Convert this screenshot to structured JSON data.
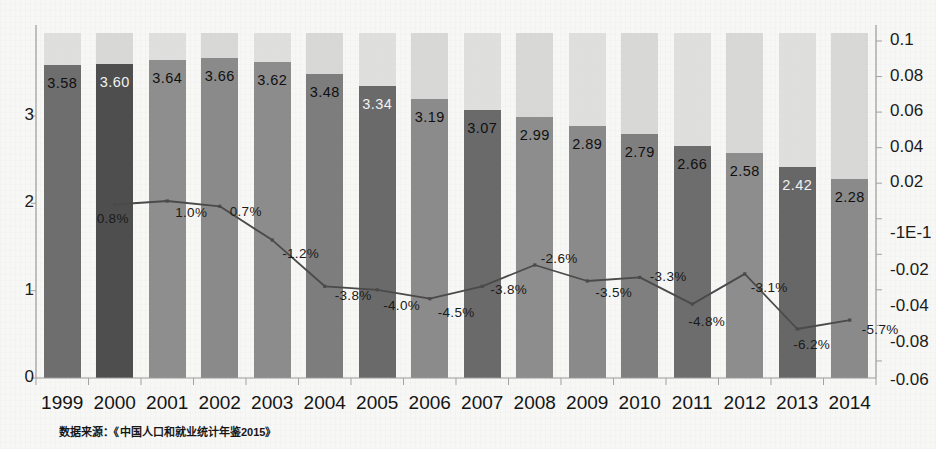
{
  "chart_data": {
    "type": "bar",
    "title": "",
    "subtitle": "",
    "xlabel": "",
    "ylabel": "",
    "grid": false,
    "legend_position": "none",
    "categories": [
      "1999",
      "2000",
      "2001",
      "2002",
      "2003",
      "2004",
      "2005",
      "2006",
      "2007",
      "2008",
      "2009",
      "2010",
      "2011",
      "2012",
      "2013",
      "2014"
    ],
    "series": [
      {
        "name": "bars",
        "type": "bar",
        "axis": "left",
        "values": [
          3.58,
          3.6,
          3.64,
          3.66,
          3.62,
          3.48,
          3.34,
          3.19,
          3.07,
          2.99,
          2.89,
          2.79,
          2.66,
          2.58,
          2.42,
          2.28
        ],
        "labels": [
          "3.58",
          "3.60",
          "3.64",
          "3.66",
          "3.62",
          "3.48",
          "3.34",
          "3.19",
          "3.07",
          "2.99",
          "2.89",
          "2.79",
          "2.66",
          "2.58",
          "2.42",
          "2.28"
        ]
      },
      {
        "name": "line",
        "type": "line",
        "axis": "right",
        "values": [
          null,
          0.008,
          0.01,
          0.007,
          -0.012,
          -0.038,
          -0.04,
          -0.045,
          -0.038,
          -0.026,
          -0.035,
          -0.033,
          -0.048,
          -0.031,
          -0.062,
          -0.057
        ],
        "labels": [
          "",
          "0.8%",
          "1.0%",
          "0.7%",
          "-1.2%",
          "-3.8%",
          "-4.0%",
          "-4.5%",
          "-3.8%",
          "-2.6%",
          "-3.5%",
          "-3.3%",
          "-4.8%",
          "-3.1%",
          "-6.2%",
          "-5.7%"
        ]
      }
    ],
    "left_axis": {
      "ticks": [
        "0",
        "1",
        "2",
        "3"
      ],
      "values": [
        0,
        1,
        2,
        3
      ],
      "ylim": [
        0,
        3.95
      ]
    },
    "right_axis": {
      "ticks": [
        "0.1",
        "0.08",
        "0.06",
        "0.04",
        "0.02",
        "-1E-1",
        "-0.02",
        "-0.04",
        "-0.08",
        "-0.06"
      ],
      "values": [
        0.1,
        0.08,
        0.06,
        0.04,
        0.02,
        0.0,
        -0.02,
        -0.04,
        -0.06,
        -0.08
      ]
    }
  },
  "footer": {
    "source_note": "数据来源：《中国人口和就业统计年鉴2015》"
  },
  "colors": {
    "bar_dark": "#6f6f6f",
    "bar_darker": "#535353",
    "bar_light": "#9a9a9a",
    "band": "#d8d8d8",
    "line": "#4a4a4a",
    "text": "#151515",
    "background": "#f7f7f6"
  }
}
